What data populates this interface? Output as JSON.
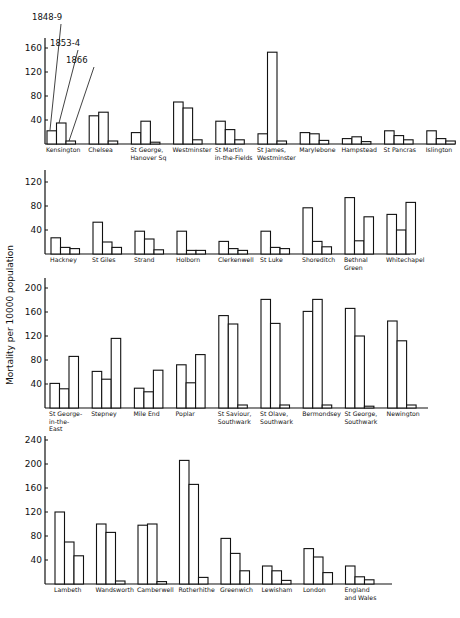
{
  "chart_data": {
    "type": "bar",
    "ylabel": "Mortality per 10000 population",
    "legend": [
      "1848-9",
      "1853-4",
      "1866"
    ],
    "series_names": [
      "1848-9",
      "1853-4",
      "1866"
    ],
    "panels": [
      {
        "id": "panel-1",
        "ylim": [
          0,
          175
        ],
        "yticks": [
          40,
          80,
          120,
          160
        ],
        "categories": [
          {
            "label": [
              "Kensington"
            ],
            "values": [
              22,
              35,
              5
            ]
          },
          {
            "label": [
              "Chelsea"
            ],
            "values": [
              47,
              53,
              5
            ]
          },
          {
            "label": [
              "St George,",
              "Hanover Sq"
            ],
            "values": [
              19,
              38,
              3
            ]
          },
          {
            "label": [
              "Westminster"
            ],
            "values": [
              70,
              60,
              7
            ]
          },
          {
            "label": [
              "St Martin",
              "in-the-Fields"
            ],
            "values": [
              38,
              24,
              7
            ]
          },
          {
            "label": [
              "St James,",
              "Westminster"
            ],
            "values": [
              17,
              153,
              5
            ]
          },
          {
            "label": [
              "Marylebone"
            ],
            "values": [
              19,
              17,
              6
            ]
          },
          {
            "label": [
              "Hampstead"
            ],
            "values": [
              9,
              12,
              4
            ]
          },
          {
            "label": [
              "St Pancras"
            ],
            "values": [
              22,
              14,
              7
            ]
          },
          {
            "label": [
              "Islington"
            ],
            "values": [
              22,
              9,
              5
            ]
          }
        ]
      },
      {
        "id": "panel-2",
        "ylim": [
          0,
          140
        ],
        "yticks": [
          40,
          80,
          120
        ],
        "categories": [
          {
            "label": [
              "Hackney"
            ],
            "values": [
              27,
              11,
              9
            ]
          },
          {
            "label": [
              "St Giles"
            ],
            "values": [
              53,
              20,
              11
            ]
          },
          {
            "label": [
              "Strand"
            ],
            "values": [
              38,
              25,
              7
            ]
          },
          {
            "label": [
              "Holborn"
            ],
            "values": [
              38,
              6,
              6
            ]
          },
          {
            "label": [
              "Clerkenwell"
            ],
            "values": [
              21,
              9,
              6
            ]
          },
          {
            "label": [
              "St Luke"
            ],
            "values": [
              38,
              11,
              9
            ]
          },
          {
            "label": [
              "Shoreditch"
            ],
            "values": [
              77,
              21,
              12
            ]
          },
          {
            "label": [
              "Bethnal",
              "Green"
            ],
            "values": [
              94,
              22,
              62
            ]
          },
          {
            "label": [
              "Whitechapel"
            ],
            "values": [
              66,
              40,
              86
            ]
          }
        ]
      },
      {
        "id": "panel-3",
        "ylim": [
          0,
          215
        ],
        "yticks": [
          40,
          80,
          120,
          160,
          200
        ],
        "categories": [
          {
            "label": [
              "St George-",
              "in-the-",
              "East"
            ],
            "values": [
              41,
              32,
              86
            ]
          },
          {
            "label": [
              "Stepney"
            ],
            "values": [
              61,
              48,
              116
            ]
          },
          {
            "label": [
              "Mile End"
            ],
            "values": [
              33,
              27,
              63
            ]
          },
          {
            "label": [
              "Poplar"
            ],
            "values": [
              72,
              42,
              89
            ]
          },
          {
            "label": [
              "St Saviour,",
              "Southwark"
            ],
            "values": [
              154,
              140,
              5
            ]
          },
          {
            "label": [
              "St Olave,",
              "Southwark"
            ],
            "values": [
              181,
              141,
              5
            ]
          },
          {
            "label": [
              "Bermondsey"
            ],
            "values": [
              161,
              181,
              5
            ]
          },
          {
            "label": [
              "St George,",
              "Southwark"
            ],
            "values": [
              166,
              120,
              3
            ]
          },
          {
            "label": [
              "Newington"
            ],
            "values": [
              145,
              112,
              5
            ]
          }
        ]
      },
      {
        "id": "panel-4",
        "ylim": [
          0,
          245
        ],
        "yticks": [
          40,
          80,
          120,
          160,
          200,
          240
        ],
        "categories": [
          {
            "label": [
              "Lambeth"
            ],
            "values": [
              120,
              70,
              47
            ],
            "fill": "plain"
          },
          {
            "label": [
              "Wandsworth"
            ],
            "values": [
              100,
              86,
              5
            ],
            "fill": "plain"
          },
          {
            "label": [
              "Camberwell"
            ],
            "values": [
              98,
              100,
              4
            ],
            "fill": "plain"
          },
          {
            "label": [
              "Rotherhithe"
            ],
            "values": [
              206,
              166,
              11
            ],
            "fill": "plain"
          },
          {
            "label": [
              "Greenwich"
            ],
            "values": [
              76,
              51,
              22
            ],
            "fill": "plain"
          },
          {
            "label": [
              "Lewisham"
            ],
            "values": [
              30,
              22,
              6
            ],
            "fill": "plain"
          },
          {
            "label": [
              "London"
            ],
            "values": [
              59,
              45,
              19
            ],
            "fill": "hatched"
          },
          {
            "label": [
              "England",
              "and Wales"
            ],
            "values": [
              30,
              12,
              7
            ],
            "fill": "dotted"
          }
        ]
      }
    ],
    "grid": false,
    "legend_position": "top-left, leader lines pointing to Kensington bars"
  }
}
